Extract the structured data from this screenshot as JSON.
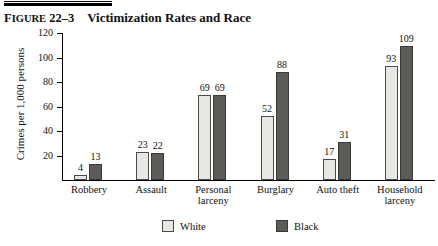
{
  "figure": {
    "number_label": "Figure 22–3",
    "number_prefix": "F",
    "number_rest": "IGURE",
    "number_value": "22–3",
    "title": "Victimization Rates and Race"
  },
  "legend": {
    "position": "bottom",
    "items": [
      {
        "label": "White",
        "color": "#e9e7e4",
        "swatch": "white-swatch"
      },
      {
        "label": "Black",
        "color": "#5d5b58",
        "swatch": "black-swatch"
      }
    ]
  },
  "chart_data": {
    "type": "bar",
    "title": "Victimization Rates and Race",
    "xlabel": "",
    "ylabel": "Crimes per 1,000 persons",
    "ylim": [
      0,
      120
    ],
    "yticks": [
      0,
      20,
      40,
      60,
      80,
      100,
      120
    ],
    "ytick_labels": [
      "",
      "20",
      "40",
      "60",
      "80",
      "100",
      "120"
    ],
    "grid": false,
    "legend_position": "bottom",
    "categories": [
      "Robbery",
      "Assault",
      "Personal larceny",
      "Burglary",
      "Auto theft",
      "Household larceny"
    ],
    "category_lines": [
      [
        "Robbery"
      ],
      [
        "Assault"
      ],
      [
        "Personal",
        "larceny"
      ],
      [
        "Burglary"
      ],
      [
        "Auto theft"
      ],
      [
        "Household",
        "larceny"
      ]
    ],
    "series": [
      {
        "name": "White",
        "color": "#e9e7e4",
        "values": [
          4,
          23,
          69,
          52,
          17,
          93
        ]
      },
      {
        "name": "Black",
        "color": "#5d5b58",
        "values": [
          13,
          22,
          69,
          88,
          31,
          109
        ]
      }
    ]
  }
}
